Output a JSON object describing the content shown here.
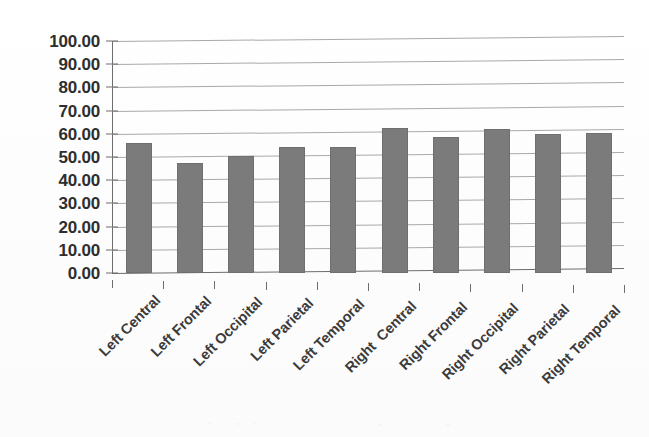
{
  "chart_data": {
    "type": "bar",
    "title": "",
    "subtitle": "",
    "xlabel": "",
    "ylabel": "",
    "categories": [
      "Left Central",
      "Left Frontal",
      "Left Occipital",
      "Left Parietal",
      "Left Temporal",
      "Right  Central",
      "Right Frontal",
      "Right Occipital",
      "Right Parietal",
      "Right Temporal"
    ],
    "values": [
      56.0,
      47.5,
      50.5,
      54.5,
      54.5,
      62.5,
      58.5,
      62.0,
      60.0,
      60.5
    ],
    "ylim": [
      0,
      100
    ],
    "ytick_step": 10,
    "ytick_labels": [
      "100.00",
      "90.00",
      "80.00",
      "70.00",
      "60.00",
      "50.00",
      "40.00",
      "30.00",
      "20.00",
      "10.00",
      "0.00"
    ],
    "ytick_values": [
      100,
      90,
      80,
      70,
      60,
      50,
      40,
      30,
      20,
      10,
      0
    ],
    "grid": true,
    "grid_axis": "y",
    "legend": false,
    "legend_position": "none",
    "series": [
      {
        "name": "",
        "values": [
          56.0,
          47.5,
          50.5,
          54.5,
          54.5,
          62.5,
          58.5,
          62.0,
          60.0,
          60.5
        ]
      }
    ],
    "colors": {
      "bar_fill": "#7b7b7b",
      "gridline": "#9a9a9a",
      "axis": "#6d6d6d",
      "tick_label": "#2e2e2e",
      "category_label": "#3b3b3b",
      "background": "#ffffff"
    }
  }
}
